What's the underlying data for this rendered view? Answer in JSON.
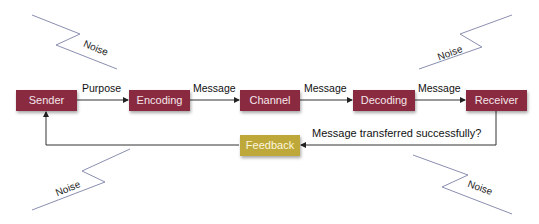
{
  "diagram": {
    "nodes": {
      "sender": "Sender",
      "encoding": "Encoding",
      "channel": "Channel",
      "decoding": "Decoding",
      "receiver": "Receiver",
      "feedback": "Feedback"
    },
    "edges": {
      "sender_encoding": "Purpose",
      "encoding_channel": "Message",
      "channel_decoding": "Message",
      "decoding_receiver": "Message",
      "receiver_feedback": "Message transferred successfully?"
    },
    "noise": {
      "top_left": "Noise",
      "top_right": "Noise",
      "bottom_left": "Noise",
      "bottom_right": "Noise"
    },
    "colors": {
      "node": "#8a2a40",
      "feedback_node": "#bfa83a",
      "noise_line": "#8a8fb0",
      "arrow": "#222222"
    }
  }
}
